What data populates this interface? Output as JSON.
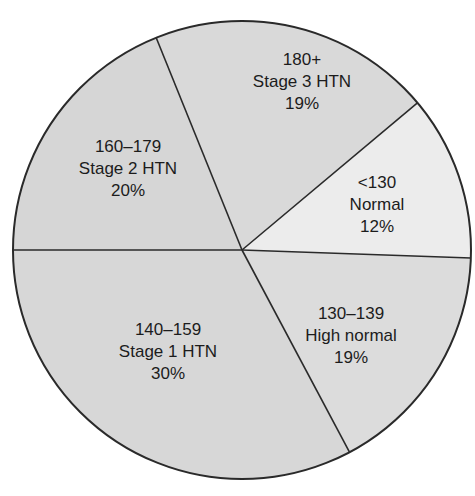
{
  "chart_data": {
    "type": "pie",
    "title": "",
    "center": [
      242,
      250
    ],
    "radius": 229,
    "start_angle_deg": -112,
    "direction": "clockwise",
    "slices": [
      {
        "range": "180+",
        "category": "Stage 3 HTN",
        "value": 19,
        "label_pct": "19%",
        "color": "#d9d9d9",
        "label_pos": [
          302,
          82
        ]
      },
      {
        "range": "<130",
        "category": "Normal",
        "value": 12,
        "label_pct": "12%",
        "color": "#ececec",
        "label_pos": [
          377,
          205
        ]
      },
      {
        "range": "130–139",
        "category": "High normal",
        "value": 19,
        "label_pct": "19%",
        "color": "#dcdcdc",
        "label_pos": [
          351,
          336
        ]
      },
      {
        "range": "140–159",
        "category": "Stage 1 HTN",
        "value": 30,
        "label_pct": "30%",
        "color": "#d7d7d7",
        "label_pos": [
          168,
          352
        ]
      },
      {
        "range": "160–179",
        "category": "Stage 2 HTN",
        "value": 20,
        "label_pct": "20%",
        "color": "#d6d6d6",
        "label_pos": [
          128,
          169
        ]
      }
    ],
    "boundary_angles_deg": [
      -112,
      -40,
      2,
      62,
      180
    ],
    "stroke_color": "#2a2a2a",
    "legend": "none"
  }
}
